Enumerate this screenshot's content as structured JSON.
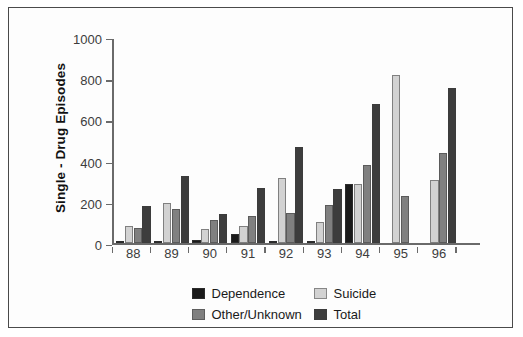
{
  "chart_data": {
    "type": "bar",
    "title": "",
    "xlabel": "",
    "ylabel": "Single - Drug Episodes",
    "categories": [
      "88",
      "89",
      "90",
      "91",
      "92",
      "93",
      "94",
      "95",
      "96"
    ],
    "ylim": [
      0,
      1000
    ],
    "yticks": [
      0,
      200,
      400,
      600,
      800,
      1000
    ],
    "ytick_labels": [
      "0",
      "200",
      "400",
      "600",
      "800",
      "1000"
    ],
    "grid": false,
    "legend_position": "bottom-center",
    "series": [
      {
        "name": "Dependence",
        "color": "#1a1a1a",
        "values": [
          10,
          12,
          15,
          45,
          12,
          10,
          290,
          null,
          null
        ]
      },
      {
        "name": "Suicide",
        "color": "#d2d2d2",
        "values": [
          85,
          195,
          70,
          85,
          320,
          105,
          290,
          820,
          310
        ]
      },
      {
        "name": "Other/Unknown",
        "color": "#808080",
        "values": [
          75,
          165,
          115,
          135,
          150,
          185,
          380,
          230,
          440
        ]
      },
      {
        "name": "Total",
        "color": "#3d3d3d",
        "values": [
          180,
          325,
          145,
          270,
          470,
          265,
          675,
          null,
          755
        ]
      }
    ]
  },
  "legend": {
    "items": [
      {
        "label": "Dependence",
        "color": "#1a1a1a"
      },
      {
        "label": "Suicide",
        "color": "#d2d2d2"
      },
      {
        "label": "Other/Unknown",
        "color": "#808080"
      },
      {
        "label": "Total",
        "color": "#3d3d3d"
      }
    ]
  }
}
